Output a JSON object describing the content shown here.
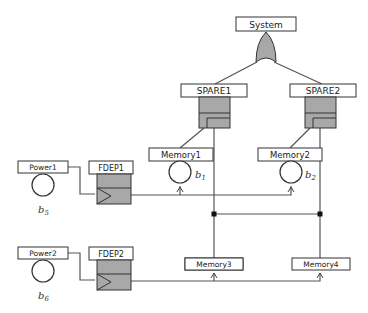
{
  "diagram": {
    "type": "dynamic-fault-tree",
    "top_event": {
      "label": "System",
      "gate": "OR"
    },
    "spare_gates": [
      {
        "label": "SPARE1"
      },
      {
        "label": "SPARE2"
      }
    ],
    "fdep_gates": [
      {
        "label": "FDEP1",
        "trigger": "Power1"
      },
      {
        "label": "FDEP2",
        "trigger": "Power2"
      }
    ],
    "basic_events": [
      {
        "label": "Memory1",
        "symbol": "b",
        "sub": "1"
      },
      {
        "label": "Memory2",
        "symbol": "b",
        "sub": "2"
      },
      {
        "label": "Memory3",
        "symbol": "b",
        "sub": "3"
      },
      {
        "label": "Memory4",
        "symbol": "b",
        "sub": "4"
      },
      {
        "label": "Power1",
        "symbol": "b",
        "sub": "5"
      },
      {
        "label": "Power2",
        "symbol": "b",
        "sub": "6"
      }
    ],
    "colors": {
      "gate_fill": "#a8a8a8",
      "line": "#555555",
      "box_border": "#333333"
    }
  }
}
